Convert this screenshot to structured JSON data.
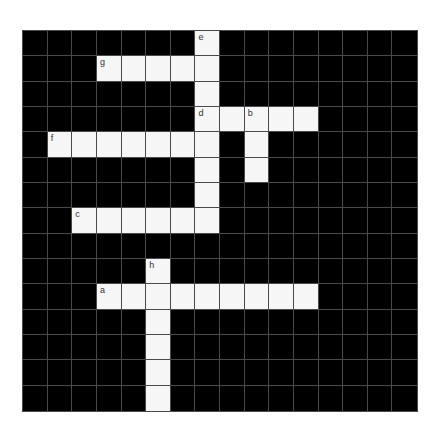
{
  "puzzle": {
    "cols": 16,
    "rows": 15,
    "colors": {
      "block": "#000000",
      "open": "#f6f6f6",
      "gridline": "#4a4a4a",
      "label": "#333333"
    },
    "entries": [
      {
        "label": "e",
        "direction": "down",
        "row": 0,
        "col": 7,
        "length": 8
      },
      {
        "label": "g",
        "direction": "across",
        "row": 1,
        "col": 3,
        "length": 5
      },
      {
        "label": "d",
        "direction": "across",
        "row": 3,
        "col": 7,
        "length": 5
      },
      {
        "label": "b",
        "direction": "down",
        "row": 3,
        "col": 9,
        "length": 3
      },
      {
        "label": "f",
        "direction": "across",
        "row": 4,
        "col": 1,
        "length": 7
      },
      {
        "label": "c",
        "direction": "across",
        "row": 7,
        "col": 2,
        "length": 6
      },
      {
        "label": "h",
        "direction": "down",
        "row": 9,
        "col": 5,
        "length": 6
      },
      {
        "label": "a",
        "direction": "across",
        "row": 10,
        "col": 3,
        "length": 9
      }
    ]
  }
}
